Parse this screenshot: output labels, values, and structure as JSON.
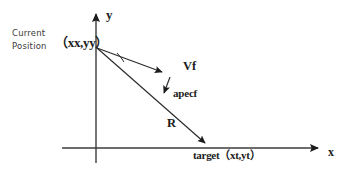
{
  "figure": {
    "background_color": "#ffffff",
    "stroke_color": "#1c1c1c",
    "axes": {
      "y_axis_label": "y",
      "x_axis_label": "x",
      "origin_x": 96,
      "origin_y": 148
    },
    "labels": {
      "current_line1": "Current",
      "current_line2": "Position",
      "current_position_coords": "（xx,yy）",
      "velocity": "Vf",
      "acceleration": "apecf",
      "range": "R",
      "target": "target（xt,yt）"
    },
    "vectors": [
      {
        "name": "vf-vector",
        "label": "Vf",
        "from": [
          97,
          48
        ],
        "to": [
          166,
          74
        ],
        "arrowhead": true
      },
      {
        "name": "apecf-vector",
        "label": "apecf",
        "from": [
          169,
          76
        ],
        "to": [
          163,
          98
        ],
        "arrowhead": true
      },
      {
        "name": "r-vector",
        "label": "R",
        "from": [
          97,
          48
        ],
        "to": [
          209,
          146
        ],
        "arrowhead": true
      }
    ],
    "angle_arc": {
      "name": "angle-arc",
      "vertex": [
        97,
        48
      ],
      "present": true
    }
  }
}
